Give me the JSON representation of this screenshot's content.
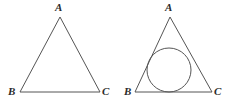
{
  "figures": [
    {
      "name": "triangle-abc",
      "labels": {
        "apex": "A",
        "bottom_left": "B",
        "bottom_right": "C"
      }
    },
    {
      "name": "triangle-abc-with-incircle",
      "labels": {
        "apex": "A",
        "bottom_left": "B",
        "bottom_right": "C"
      }
    }
  ],
  "style": {
    "stroke_color": "#555555",
    "label_color": "#2b2b2b",
    "background_color": "#ffffff"
  }
}
